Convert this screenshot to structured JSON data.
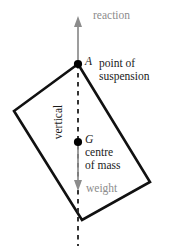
{
  "diagram": {
    "colors": {
      "body_outline": "#111111",
      "force_arrow": "#8c8c8c",
      "vertical_dashed": "#2b2b2b",
      "point_marker": "#000000",
      "label_text": "#1a1a1a",
      "label_text_muted": "#8c8c8c",
      "background": "#ffffff"
    },
    "labels": {
      "reaction": "reaction",
      "point_A": "A",
      "point_of_suspension": "point of\nsuspension",
      "vertical": "vertical",
      "point_G": "G",
      "centre_of_mass": "centre\nof mass",
      "weight": "weight"
    },
    "points": {
      "A": {
        "x": 78,
        "y": 64,
        "label": "A",
        "role": "point of suspension"
      },
      "G": {
        "x": 78,
        "y": 142,
        "label": "G",
        "role": "centre of mass"
      }
    },
    "body_outline_path": "M78,64 L14,111 L82,220 L150,182 Z",
    "body_vertices": [
      {
        "x": 78,
        "y": 64
      },
      {
        "x": 14,
        "y": 111
      },
      {
        "x": 82,
        "y": 220
      },
      {
        "x": 150,
        "y": 182
      }
    ],
    "vertical_line": {
      "x": 78,
      "y_top": 64,
      "y_bottom": 246,
      "style": "dashed"
    },
    "reaction_arrow": {
      "x": 78,
      "y_tail": 64,
      "y_head": 18,
      "direction": "up"
    },
    "weight_arrow": {
      "x": 78,
      "y_tail": 142,
      "y_head": 190,
      "direction": "down"
    }
  }
}
